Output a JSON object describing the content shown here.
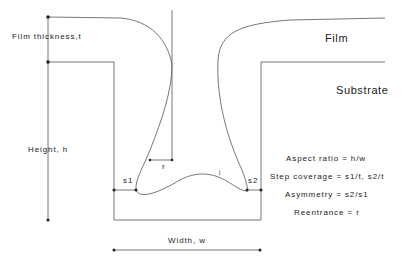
{
  "diagram": {
    "layers": {
      "film": "Film",
      "substrate": "Substrate"
    },
    "dimensions": {
      "film_thickness": "Film thickness,t",
      "height": "Height, h",
      "width": "Width, w",
      "reentrance_marker": "r",
      "sidewall_left": "s1",
      "sidewall_right": "s2",
      "void_marker": "ʲ"
    },
    "definitions": [
      "Aspect ratio = h/w",
      "Step coverage = s1/t, s2/t",
      "Asymmetry = s2/s1",
      "Reentrance = r"
    ]
  }
}
